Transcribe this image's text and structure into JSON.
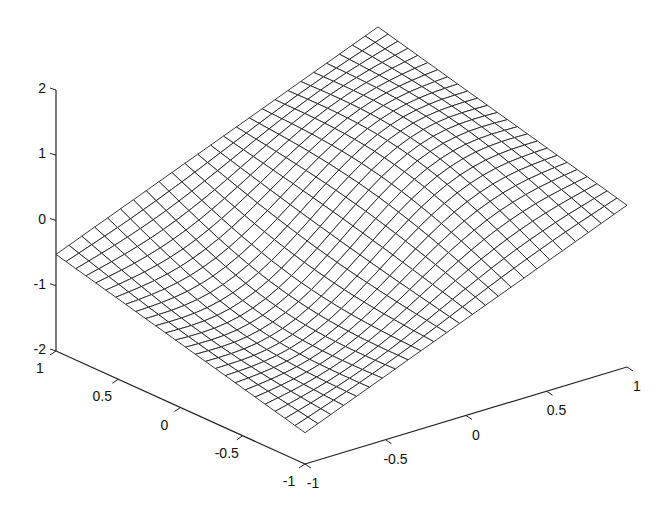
{
  "chart_data": {
    "type": "surface",
    "title": "",
    "xlabel": "",
    "ylabel": "",
    "zlabel": "",
    "grid": false,
    "mesh_resolution": 25,
    "axes": {
      "x": {
        "range": [
          -1,
          1
        ],
        "ticks": [
          -1,
          -0.5,
          0,
          0.5,
          1
        ],
        "tick_labels": [
          "-1",
          "-0.5",
          "0",
          "0.5",
          "1"
        ]
      },
      "y": {
        "range": [
          -1,
          1
        ],
        "ticks": [
          -1,
          -0.5,
          0,
          0.5,
          1
        ],
        "tick_labels": [
          "-1",
          "-0.5",
          "0",
          "0.5",
          "1"
        ]
      },
      "z": {
        "range": [
          -2,
          2
        ],
        "ticks": [
          -2,
          -1,
          0,
          1,
          2
        ],
        "tick_labels": [
          "-2",
          "-1",
          "0",
          "1",
          "2"
        ]
      }
    },
    "corner_values": [
      {
        "x": -1,
        "y": -1,
        "z": -1.5
      },
      {
        "x": 1,
        "y": -1,
        "z": 0.45
      },
      {
        "x": -1,
        "y": 1,
        "z": -0.54
      },
      {
        "x": 1,
        "y": 1,
        "z": 1.46
      }
    ],
    "surface_model": "z ≈ x + 0.5·y + 0.35·sin(π·x)·cos(π·y/2) (wavy saddle-like mesh)",
    "line_color": "#222222",
    "background": "#ffffff"
  }
}
